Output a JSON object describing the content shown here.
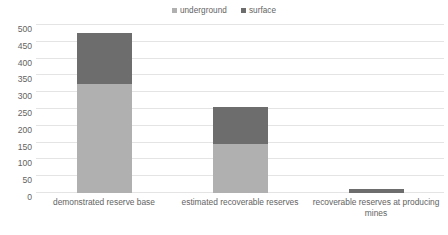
{
  "chart_data": {
    "type": "bar",
    "subtype": "stacked",
    "title": "",
    "subtitle": "",
    "xlabel": "",
    "ylabel": "",
    "categories": [
      "demonstrated reserve base",
      "estimated recoverable reserves",
      "recoverable reserves at producing mines"
    ],
    "series": [
      {
        "name": "underground",
        "color": "#b0b0b0",
        "values": [
          325,
          145,
          0
        ]
      },
      {
        "name": "surface",
        "color": "#6d6d6d",
        "values": [
          150,
          110,
          13
        ]
      }
    ],
    "totals": [
      475,
      255,
      13
    ],
    "ylim": [
      0,
      500
    ],
    "yticks": [
      0,
      50,
      100,
      150,
      200,
      250,
      300,
      350,
      400,
      450,
      500
    ],
    "ytick_labels": [
      "0",
      "50",
      "100",
      "150",
      "200",
      "250",
      "300",
      "350",
      "400",
      "450",
      "500"
    ],
    "grid": true,
    "legend_position": "top-center",
    "legend_entries": [
      "underground",
      "surface"
    ],
    "background": "#ffffff",
    "gridline_color": "#e4e4e4",
    "text_color": "#636363"
  },
  "legend": {
    "items": [
      {
        "label": "underground"
      },
      {
        "label": "surface"
      }
    ]
  },
  "axis": {
    "y_labels": [
      "500",
      "450",
      "400",
      "350",
      "300",
      "250",
      "200",
      "150",
      "100",
      "50",
      "0"
    ],
    "x_labels": [
      "demonstrated reserve base",
      "estimated recoverable reserves",
      "recoverable reserves at producing mines"
    ]
  }
}
